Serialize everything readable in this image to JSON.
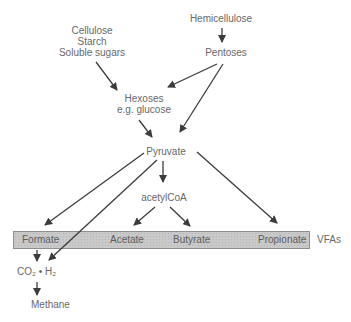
{
  "diagram": {
    "nodes": {
      "source_group": [
        "Cellulose",
        "Starch",
        "Soluble sugars"
      ],
      "hemicellulose": "Hemicellulose",
      "pentoses": "Pentoses",
      "hexoses_line1": "Hexoses",
      "hexoses_line2": "e.g. glucose",
      "pyruvate": "Pyruvate",
      "acetylcoa": "acetylCoA",
      "formate": "Formate",
      "acetate": "Acetate",
      "butyrate": "Butyrate",
      "propionate": "Propionate",
      "vfas_label": "VFAs",
      "co2_h2": "CO₂ • H₂",
      "methane": "Methane"
    },
    "edges": [
      {
        "from": "Hemicellulose",
        "to": "Pentoses"
      },
      {
        "from": "Cellulose / Starch / Soluble sugars",
        "to": "Hexoses"
      },
      {
        "from": "Pentoses",
        "to": "Hexoses"
      },
      {
        "from": "Pentoses",
        "to": "Pyruvate"
      },
      {
        "from": "Hexoses",
        "to": "Pyruvate"
      },
      {
        "from": "Pyruvate",
        "to": "acetylCoA"
      },
      {
        "from": "Pyruvate",
        "to": "Formate"
      },
      {
        "from": "Pyruvate",
        "to": "CO₂ • H₂"
      },
      {
        "from": "Pyruvate",
        "to": "Propionate"
      },
      {
        "from": "acetylCoA",
        "to": "Acetate"
      },
      {
        "from": "acetylCoA",
        "to": "Butyrate"
      },
      {
        "from": "Formate",
        "to": "CO₂ • H₂"
      },
      {
        "from": "CO₂ • H₂",
        "to": "Methane"
      }
    ],
    "colors": {
      "text": "#686868",
      "arrow": "#3c3c3c",
      "bar_fill": "#c9c9c9",
      "bar_border": "#8e8e8e",
      "background": "#ffffff"
    }
  }
}
